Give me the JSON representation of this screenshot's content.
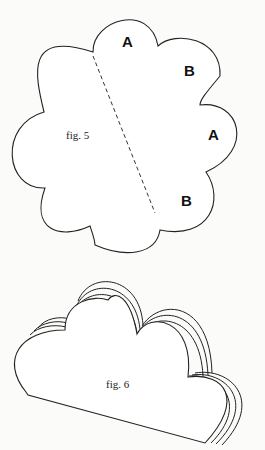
{
  "figures": [
    {
      "id": "fig5",
      "caption": "fig. 5",
      "shape": "eight-lobed flower with dashed fold line",
      "lobe_labels": [
        {
          "text": "A",
          "x": 127,
          "y": 47
        },
        {
          "text": "B",
          "x": 189,
          "y": 76
        },
        {
          "text": "A",
          "x": 213,
          "y": 140
        },
        {
          "text": "B",
          "x": 185,
          "y": 204
        }
      ]
    },
    {
      "id": "fig6",
      "caption": "fig. 6",
      "shape": "layered cloud shape"
    }
  ],
  "colors": {
    "background": "#fbfbfa",
    "line": "#222222"
  }
}
